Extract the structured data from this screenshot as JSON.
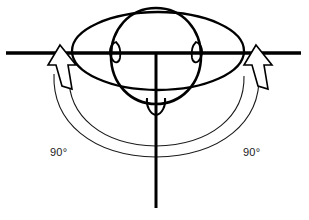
{
  "figure": {
    "background_color": "#ffffff",
    "line_color": "#000000",
    "arc_color": "#1a1a1a"
  },
  "labels": {
    "left_angle": "90°",
    "right_angle": "90°"
  },
  "axes": {
    "horizontal": {
      "name": "horizontal-reference-line",
      "x1": 6,
      "y1": 53,
      "x2": 301,
      "y2": 53,
      "width": 3.4
    },
    "vertical": {
      "name": "vertical-midline",
      "x1": 156,
      "y1": 53,
      "x2": 156,
      "y2": 208,
      "width": 3.0
    }
  },
  "shapes": {
    "shoulders_ellipse": {
      "name": "shoulders-ellipse",
      "cx": 158,
      "cy": 51,
      "rx": 86,
      "ry": 39,
      "stroke_width": 2.3
    },
    "head_oval": {
      "name": "head-oval",
      "cx": 156,
      "cy": 56,
      "rx": 44,
      "ry": 48,
      "stroke_width": 2.6
    },
    "nose": {
      "name": "nose-shape",
      "stroke_width": 2.0
    },
    "ear_left": {
      "name": "left-ear",
      "stroke_width": 1.8
    },
    "ear_right": {
      "name": "right-ear",
      "stroke_width": 1.8
    }
  },
  "arcs": [
    {
      "name": "left-rotation-arc",
      "side": "left"
    },
    {
      "name": "right-rotation-arc",
      "side": "right"
    }
  ],
  "arrows": [
    {
      "name": "left-rotation-arrow",
      "direction": "up",
      "x": 60,
      "y": 56
    },
    {
      "name": "right-rotation-arrow",
      "direction": "up",
      "x": 256,
      "y": 56
    }
  ]
}
